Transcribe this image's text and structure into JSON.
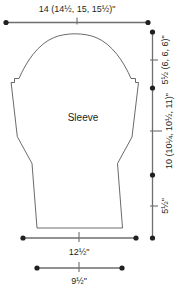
{
  "diagram": {
    "shape_label": "Sleeve",
    "colors": {
      "outline": "#58595b",
      "dimension_line": "#6d6e71",
      "text": "#231f20",
      "background": "#ffffff"
    },
    "dimensions": {
      "top_width": {
        "text": "14 (14½, 15, 15½)\"",
        "base": "14",
        "alternates": "14½, 15, 15½",
        "unit": "\"",
        "orientation": "horizontal",
        "position": "top"
      },
      "cap_height": {
        "text": "5½ (6, 6, 6)\"",
        "base": "5½",
        "alternates": "6, 6, 6",
        "unit": "\"",
        "orientation": "vertical",
        "position": "right-upper"
      },
      "sleeve_length": {
        "text": "10 (10¼, 10½, 11)\"",
        "base": "10",
        "alternates": "10¼, 10½, 11",
        "unit": "\"",
        "orientation": "vertical",
        "position": "right-middle"
      },
      "cuff_height": {
        "text": "5½\"",
        "base": "5½",
        "alternates": "",
        "unit": "\"",
        "orientation": "vertical",
        "position": "right-lower"
      },
      "lower_width": {
        "text": "12½\"",
        "base": "12½",
        "alternates": "",
        "unit": "\"",
        "orientation": "horizontal",
        "position": "bottom-upper"
      },
      "cuff_width": {
        "text": "9½\"",
        "base": "9½",
        "alternates": "",
        "unit": "\"",
        "orientation": "horizontal",
        "position": "bottom-lower"
      }
    }
  }
}
